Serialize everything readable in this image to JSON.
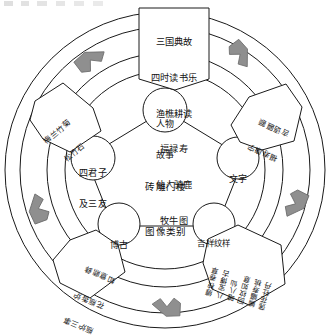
{
  "figure": {
    "type": "radial-classification-diagram",
    "center_title_lines": [
      "砖雕门楼",
      "图像类别"
    ],
    "ring_count": 3,
    "flow_direction": "counter-clockwise",
    "colors": {
      "stroke": "#1a1a1a",
      "arrow_fill": "#8f8f8f",
      "arrow_stroke": "#6a6a6a",
      "box_fill": "#ffffff",
      "background": "#ffffff"
    }
  },
  "center": {
    "line1": "砖雕门楼",
    "line2": "图像类别"
  },
  "nodes": [
    {
      "id": "figures",
      "line1": "人物",
      "line2": "故事",
      "position": "top"
    },
    {
      "id": "text",
      "line1": "文字",
      "line2": "",
      "position": "right"
    },
    {
      "id": "auspicious",
      "line1": "吉祥纹样",
      "line2": "",
      "position": "bottom-right"
    },
    {
      "id": "antiques",
      "line1": "博古",
      "line2": "",
      "position": "bottom-left"
    },
    {
      "id": "gentlemen",
      "line1": "四君子",
      "line2": "及三友",
      "position": "left"
    }
  ],
  "callouts": [
    {
      "id": "figures-callout",
      "for": "人物故事",
      "position": "top",
      "rotation_deg": 0,
      "lines": [
        "三国典故",
        "四时读书乐",
        "渔樵耕读",
        "福禄寿",
        "仙人骑鹿",
        "牧牛图"
      ]
    },
    {
      "id": "gentlemen-callout",
      "for": "四君子及三友",
      "position": "upper-left",
      "rotation_deg": -40,
      "lines": [
        "梅兰竹菊",
        "松竹石"
      ]
    },
    {
      "id": "text-callout",
      "for": "文字",
      "position": "upper-right",
      "rotation_deg": 205,
      "lines": [
        "福寿康宁",
        "吉语匾额"
      ]
    },
    {
      "id": "antiques-callout",
      "for": "博古",
      "position": "lower-left",
      "rotation_deg": 203,
      "lines": [
        "瓶炉三事",
        "花瓶香炉",
        "如意鼎彝"
      ]
    },
    {
      "id": "auspicious-callout",
      "for": "吉祥纹样",
      "position": "lower-right",
      "rotation_deg": 195,
      "lines": [
        "缠枝卷草",
        "八宝博古",
        "暗八仙",
        "回纹如意",
        "蝙蝠寿桃",
        "莲花牡丹"
      ]
    }
  ],
  "arrows": [
    {
      "id": "arrow-top-left",
      "direction": "up-right",
      "angle_deg": 315
    },
    {
      "id": "arrow-top-right",
      "direction": "down-right",
      "angle_deg": 45
    },
    {
      "id": "arrow-right",
      "direction": "down",
      "angle_deg": 110
    },
    {
      "id": "arrow-bottom",
      "direction": "left",
      "angle_deg": 180
    },
    {
      "id": "arrow-left",
      "direction": "up",
      "angle_deg": 265
    }
  ]
}
